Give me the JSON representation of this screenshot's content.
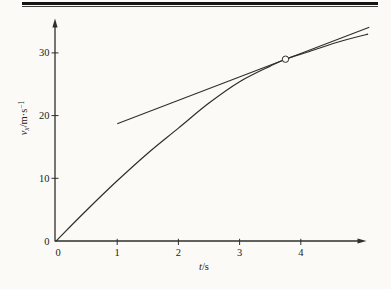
{
  "figure": {
    "background": "#fbfaf7",
    "ink_color": "#2e2e2c",
    "top_rule_color": "#141414"
  },
  "chart_data": {
    "type": "line",
    "title": "",
    "xlabel": {
      "symbol": "t",
      "unit": "/s"
    },
    "ylabel": {
      "symbol": "v",
      "subscript": "x",
      "unit": "/m·s",
      "unit_exponent": "−1"
    },
    "xlim": [
      0,
      5.2
    ],
    "ylim": [
      0,
      35
    ],
    "x_ticks": [
      0,
      1,
      2,
      3,
      4
    ],
    "y_ticks": [
      0,
      10,
      20,
      30
    ],
    "x_tick_labels": [
      "0",
      "1",
      "2",
      "3",
      "4"
    ],
    "y_tick_labels": [
      "0",
      "10",
      "20",
      "30"
    ],
    "grid": false,
    "legend": null,
    "series": [
      {
        "name": "velocity curve",
        "type": "curve",
        "t": [
          0,
          0.5,
          1,
          1.5,
          2,
          2.5,
          3,
          3.5,
          3.75,
          4.1,
          4.6,
          5.1
        ],
        "v": [
          0,
          4.9,
          9.6,
          14.0,
          18.0,
          22.0,
          25.4,
          27.9,
          29.0,
          30.1,
          31.7,
          33.0
        ]
      },
      {
        "name": "tangent line",
        "type": "straight",
        "t": [
          1.0,
          5.12
        ],
        "v": [
          18.7,
          34.1
        ]
      }
    ],
    "tangent_point": {
      "t": 3.75,
      "v": 29,
      "marker": "open-circle"
    }
  }
}
